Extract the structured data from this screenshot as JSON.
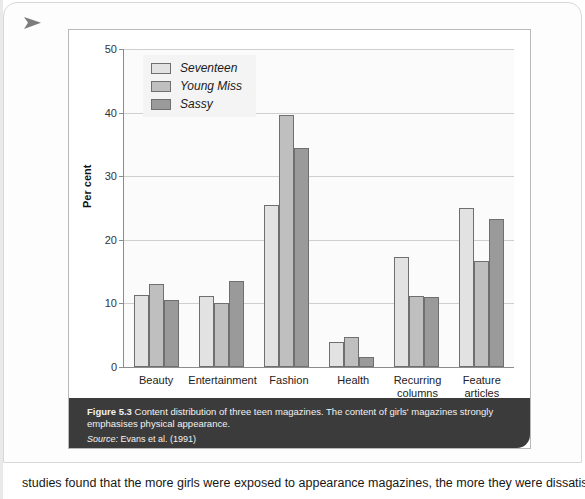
{
  "page": {
    "corner_marker_icon": "arrow-right-triangle-icon",
    "body_text": "studies found that the more girls were exposed to appearance magazines, the more they were dissatisfied"
  },
  "figure": {
    "caption_label": "Figure 5.3",
    "caption_text": "Content distribution of three teen magazines. The content of girls' magazines strongly emphasises physical appearance.",
    "source_label": "Source:",
    "source_text": "Evans et al. (1991)"
  },
  "colors": {
    "series_seventeen": "#e2e2e2",
    "series_young_miss": "#bfbfbf",
    "series_sassy": "#9a9a9a",
    "bar_outline": "#6f6f6f",
    "caption_background": "#3b3b3b",
    "gridline": "#cfcfcf",
    "axis": "#8c8c8c"
  },
  "chart_data": {
    "type": "bar",
    "title": "",
    "xlabel": "",
    "ylabel": "Per cent",
    "ylim": [
      0,
      50
    ],
    "yticks": [
      0,
      10,
      20,
      30,
      40,
      50
    ],
    "grid": true,
    "legend_position": "top-left",
    "categories": [
      "Beauty",
      "Entertainment",
      "Fashion",
      "Health",
      "Recurring columns",
      "Feature articles"
    ],
    "series": [
      {
        "name": "Seventeen",
        "values": [
          11.4,
          11.1,
          25.5,
          4.0,
          17.3,
          25.0
        ]
      },
      {
        "name": "Young Miss",
        "values": [
          13.0,
          10.0,
          39.7,
          4.7,
          11.1,
          16.6
        ]
      },
      {
        "name": "Sassy",
        "values": [
          10.5,
          13.5,
          34.5,
          1.5,
          11.0,
          23.2
        ]
      }
    ]
  }
}
